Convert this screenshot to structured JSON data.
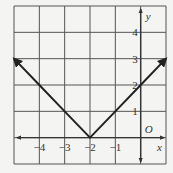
{
  "chart_data": {
    "type": "line",
    "title": "",
    "function": "y = |x + 2|",
    "xlabel": "x",
    "ylabel": "y",
    "origin_label": "O",
    "xlim": [
      -5,
      1
    ],
    "ylim": [
      -1,
      5
    ],
    "grid": true,
    "x_tick_labels": [
      "-4",
      "-3",
      "-2",
      "-1"
    ],
    "x_ticks": [
      -4,
      -3,
      -2,
      -1
    ],
    "y_tick_labels": [
      "1",
      "2",
      "3",
      "4"
    ],
    "y_ticks": [
      1,
      2,
      3,
      4
    ],
    "series": [
      {
        "name": "y = |x + 2|",
        "x": [
          -5,
          -4,
          -3,
          -2,
          -1,
          0,
          1
        ],
        "y": [
          3,
          2,
          1,
          0,
          1,
          2,
          3
        ],
        "arrows_at_ends": true
      }
    ],
    "vertex": [
      -2,
      0
    ]
  },
  "colors": {
    "background": "#f4f4f2",
    "grid": "#555555",
    "axis": "#333333",
    "line": "#222222"
  }
}
